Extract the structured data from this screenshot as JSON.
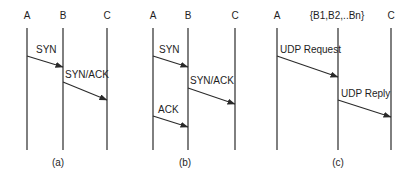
{
  "panels": [
    {
      "caption": "(a)",
      "nodes": [
        {
          "label": "A",
          "x": 27
        },
        {
          "label": "B",
          "x": 63
        },
        {
          "label": "C",
          "x": 107
        }
      ],
      "messages": [
        {
          "label": "SYN",
          "x1": 27,
          "y1": 56,
          "x2": 63,
          "y2": 67
        },
        {
          "label": "SYN/ACK",
          "x1": 63,
          "y1": 82,
          "x2": 107,
          "y2": 100
        }
      ]
    },
    {
      "caption": "(b)",
      "nodes": [
        {
          "label": "A",
          "x": 153
        },
        {
          "label": "B",
          "x": 188
        },
        {
          "label": "C",
          "x": 235
        }
      ],
      "messages": [
        {
          "label": "SYN",
          "x1": 153,
          "y1": 56,
          "x2": 188,
          "y2": 67
        },
        {
          "label": "SYN/ACK",
          "x1": 188,
          "y1": 88,
          "x2": 235,
          "y2": 104
        },
        {
          "label": "ACK",
          "x1": 153,
          "y1": 116,
          "x2": 188,
          "y2": 127
        }
      ]
    },
    {
      "caption": "(c)",
      "nodes": [
        {
          "label": "A",
          "x": 277
        },
        {
          "label": "{B1,B2,..Bn}",
          "x": 338
        },
        {
          "label": "C",
          "x": 391
        }
      ],
      "messages": [
        {
          "label": "UDP Request",
          "x1": 277,
          "y1": 56,
          "x2": 338,
          "y2": 77
        },
        {
          "label": "UDP Reply",
          "x1": 338,
          "y1": 100,
          "x2": 391,
          "y2": 117
        }
      ]
    }
  ]
}
